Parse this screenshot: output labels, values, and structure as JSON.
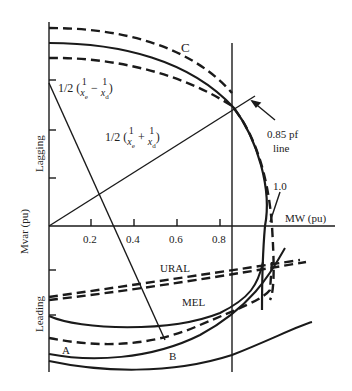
{
  "diagram": {
    "type": "generator capability curve",
    "x_axis": {
      "label": "MW (pu)",
      "ticks": [
        "0.2",
        "0.4",
        "0.6",
        "0.8"
      ]
    },
    "y_axis": {
      "label": "Mvar (pu)",
      "upper_label": "Lagging",
      "lower_label": "Leading"
    },
    "labels": {
      "curve_c": "C",
      "point_a": "A",
      "point_b": "B",
      "ural": "URAL",
      "mel": "MEL",
      "pf_line": "0.85 pf",
      "pf_line_2": "line",
      "unity": "1.0"
    },
    "formulas": {
      "diff": {
        "half": "1/2",
        "text": "(1/xe − 1/xd)",
        "num1": "1",
        "den1": "x",
        "sub1": "e",
        "op": "−",
        "num2": "1",
        "den2": "x",
        "sub2": "d"
      },
      "sum": {
        "half": "1/2",
        "text": "(1/xe + 1/xd)",
        "num1": "1",
        "den1": "x",
        "sub1": "e",
        "op": "+",
        "num2": "1",
        "den2": "x",
        "sub2": "d"
      }
    },
    "colors": {
      "ink": "#1a1a1a",
      "background": "#ffffff"
    }
  }
}
